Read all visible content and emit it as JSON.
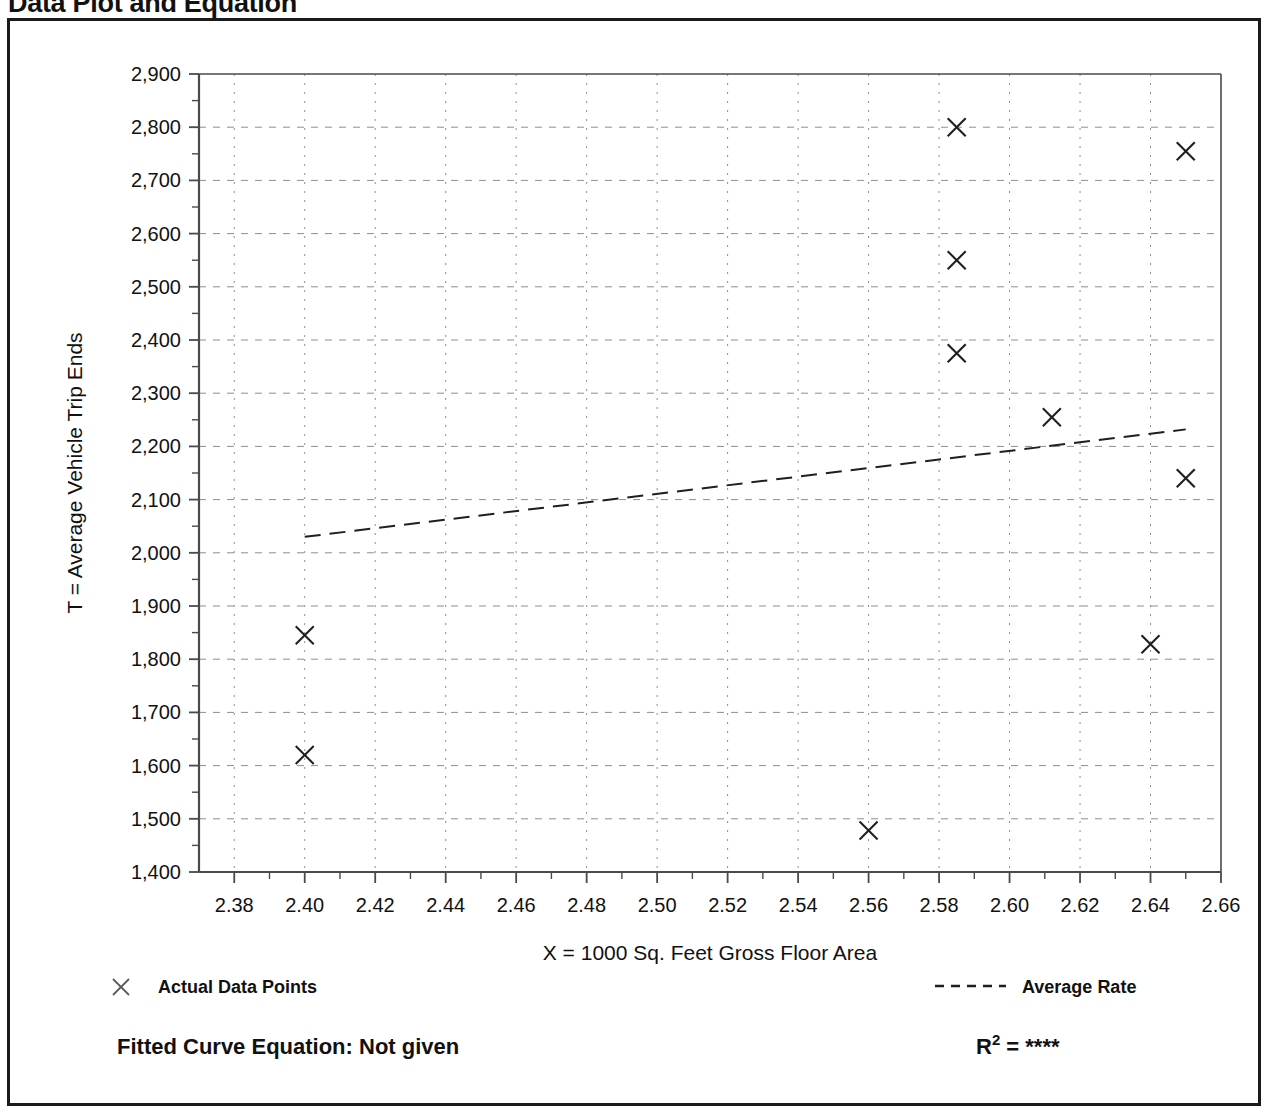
{
  "title": "Data Plot and Equation",
  "chart_data": {
    "type": "scatter",
    "title": "Data Plot and Equation",
    "xlabel": "X = 1000 Sq. Feet Gross Floor Area",
    "ylabel": "T = Average Vehicle Trip Ends",
    "xlim": [
      2.37,
      2.66
    ],
    "ylim": [
      1400,
      2900
    ],
    "xticks": [
      "2.38",
      "2.40",
      "2.42",
      "2.44",
      "2.46",
      "2.48",
      "2.50",
      "2.52",
      "2.54",
      "2.56",
      "2.58",
      "2.60",
      "2.62",
      "2.64",
      "2.66"
    ],
    "xtick_values": [
      2.38,
      2.4,
      2.42,
      2.44,
      2.46,
      2.48,
      2.5,
      2.52,
      2.54,
      2.56,
      2.58,
      2.6,
      2.62,
      2.64,
      2.66
    ],
    "yticks": [
      "1,400",
      "1,500",
      "1,600",
      "1,700",
      "1,800",
      "1,900",
      "2,000",
      "2,100",
      "2,200",
      "2,300",
      "2,400",
      "2,500",
      "2,600",
      "2,700",
      "2,800",
      "2,900"
    ],
    "ytick_values": [
      1400,
      1500,
      1600,
      1700,
      1800,
      1900,
      2000,
      2100,
      2200,
      2300,
      2400,
      2500,
      2600,
      2700,
      2800,
      2900
    ],
    "grid": true,
    "grid_style": "dashed",
    "minor_ticks": true,
    "series": [
      {
        "name": "Actual Data Points",
        "type": "scatter",
        "marker": "x",
        "points": [
          {
            "x": 2.4,
            "y": 1845
          },
          {
            "x": 2.4,
            "y": 1620
          },
          {
            "x": 2.56,
            "y": 1478
          },
          {
            "x": 2.585,
            "y": 2800
          },
          {
            "x": 2.585,
            "y": 2550
          },
          {
            "x": 2.585,
            "y": 2375
          },
          {
            "x": 2.612,
            "y": 2255
          },
          {
            "x": 2.64,
            "y": 1828
          },
          {
            "x": 2.65,
            "y": 2755
          },
          {
            "x": 2.65,
            "y": 2140
          }
        ]
      },
      {
        "name": "Average Rate",
        "type": "line",
        "style": "dashed",
        "points": [
          {
            "x": 2.4,
            "y": 2030
          },
          {
            "x": 2.65,
            "y": 2232
          }
        ]
      }
    ]
  },
  "legend": {
    "position": "below-axes",
    "items": [
      {
        "label": "Actual Data Points",
        "marker": "x-marker"
      },
      {
        "label": "Average Rate",
        "marker": "dashed-line"
      }
    ]
  },
  "footer": {
    "equation_label": "Fitted Curve Equation:  Not given",
    "r_symbol": "R",
    "r_exponent": "2",
    "r_equals": "=",
    "r_value": "****"
  }
}
